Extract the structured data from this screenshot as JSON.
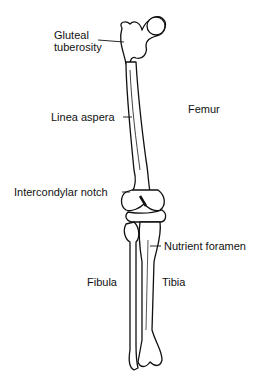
{
  "diagram": {
    "labels": {
      "gluteal_tuberosity_line1": "Gluteal",
      "gluteal_tuberosity_line2": "tuberosity",
      "linea_aspera": "Linea aspera",
      "femur": "Femur",
      "intercondylar_notch": "Intercondylar notch",
      "nutrient_foramen": "Nutrient foramen",
      "fibula": "Fibula",
      "tibia": "Tibia"
    },
    "colors": {
      "ink": "#111111",
      "bone": "#ffffff",
      "shade": "#555555"
    }
  }
}
